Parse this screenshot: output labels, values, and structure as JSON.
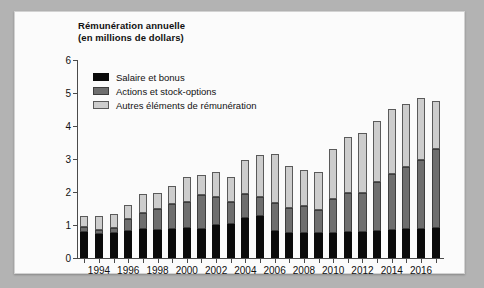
{
  "figure": {
    "title_line1": "Rémunération annuelle",
    "title_line2": "(en millions de dollars)"
  },
  "chart_data": {
    "type": "bar",
    "subtype": "stacked",
    "title": "Rémunération annuelle (en millions de dollars)",
    "xlabel": "",
    "ylabel": "en millions de dollars",
    "ylim": [
      0,
      6
    ],
    "yticks": [
      0,
      1,
      2,
      3,
      4,
      5,
      6
    ],
    "ytick_labels": [
      "0",
      "1",
      "2",
      "3",
      "4",
      "5",
      "6"
    ],
    "grid": false,
    "legend_position": "upper-left inside",
    "categories": [
      "1993",
      "1994",
      "1995",
      "1996",
      "1997",
      "1998",
      "1999",
      "2000",
      "2001",
      "2002",
      "2003",
      "2004",
      "2005",
      "2006",
      "2007",
      "2008",
      "2009",
      "2010",
      "2011",
      "2012",
      "2013",
      "2014",
      "2015",
      "2016",
      "2017"
    ],
    "xtick_labels": [
      "1994",
      "1996",
      "1998",
      "2000",
      "2002",
      "2004",
      "2006",
      "2008",
      "2010",
      "2012",
      "2014",
      "2016"
    ],
    "series": [
      {
        "name": "Salaire et bonus",
        "color": "#0a0a0a",
        "values": [
          0.78,
          0.72,
          0.77,
          0.81,
          0.88,
          0.86,
          0.88,
          0.9,
          0.88,
          0.99,
          1.04,
          1.21,
          1.27,
          0.83,
          0.75,
          0.77,
          0.77,
          0.77,
          0.78,
          0.8,
          0.82,
          0.86,
          0.87,
          0.87,
          0.9
        ]
      },
      {
        "name": "Actions et stock-options",
        "color": "#6e6e6e",
        "values": [
          0.15,
          0.14,
          0.14,
          0.37,
          0.47,
          0.62,
          0.75,
          0.8,
          1.02,
          0.87,
          0.67,
          0.74,
          0.59,
          0.83,
          0.78,
          0.82,
          0.7,
          1.03,
          1.18,
          1.17,
          1.47,
          1.68,
          1.9,
          2.09,
          2.4
        ]
      },
      {
        "name": "Autres éléments de rémunération",
        "color": "#cdcdcd",
        "values": [
          0.34,
          0.4,
          0.41,
          0.42,
          0.6,
          0.5,
          0.56,
          0.75,
          0.62,
          0.74,
          0.75,
          1.03,
          1.25,
          1.5,
          1.25,
          1.08,
          1.15,
          1.51,
          1.72,
          1.81,
          1.85,
          1.98,
          1.91,
          1.88,
          1.45
        ]
      }
    ],
    "totals": [
      1.27,
      1.26,
      1.32,
      1.6,
      1.95,
      1.98,
      2.19,
      2.45,
      2.52,
      2.6,
      2.46,
      2.98,
      3.11,
      3.16,
      2.78,
      2.67,
      2.62,
      3.31,
      3.68,
      3.78,
      4.14,
      4.52,
      4.68,
      4.84,
      4.75
    ]
  },
  "colors": {
    "page_background": "#b3b3b3",
    "card_background": "#fbfbfb",
    "axis": "#4a4a4a",
    "text": "#111111"
  }
}
